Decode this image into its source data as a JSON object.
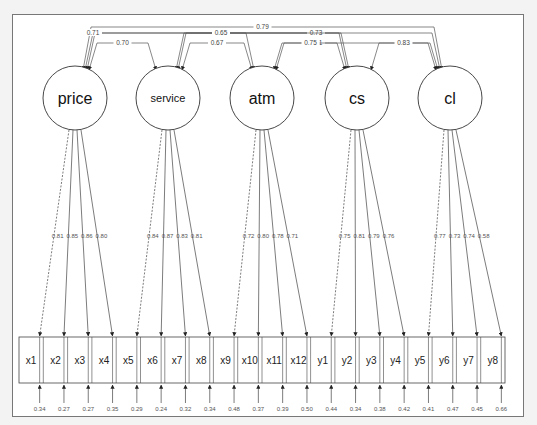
{
  "diagram": {
    "type": "CFA path diagram",
    "latents": [
      {
        "id": "price",
        "label": "price",
        "cx": 75,
        "font": 16
      },
      {
        "id": "service",
        "label": "service",
        "cx": 168,
        "font": 11
      },
      {
        "id": "atm",
        "label": "atm",
        "cx": 262,
        "font": 16
      },
      {
        "id": "cs",
        "label": "cs",
        "cx": 357,
        "font": 16
      },
      {
        "id": "cl",
        "label": "cl",
        "cx": 450,
        "font": 16
      }
    ],
    "indicators": [
      {
        "label": "x1",
        "factor": "price",
        "loading": "0.81",
        "error": "0.34",
        "fixed": true
      },
      {
        "label": "x2",
        "factor": "price",
        "loading": "0.85",
        "error": "0.27",
        "fixed": false
      },
      {
        "label": "x3",
        "factor": "price",
        "loading": "0.86",
        "error": "0.27",
        "fixed": false
      },
      {
        "label": "x4",
        "factor": "price",
        "loading": "0.80",
        "error": "0.35",
        "fixed": false
      },
      {
        "label": "x5",
        "factor": "service",
        "loading": "0.84",
        "error": "0.29",
        "fixed": true
      },
      {
        "label": "x6",
        "factor": "service",
        "loading": "0.87",
        "error": "0.24",
        "fixed": false
      },
      {
        "label": "x7",
        "factor": "service",
        "loading": "0.83",
        "error": "0.32",
        "fixed": false
      },
      {
        "label": "x8",
        "factor": "service",
        "loading": "0.81",
        "error": "0.34",
        "fixed": false
      },
      {
        "label": "x9",
        "factor": "atm",
        "loading": "0.72",
        "error": "0.48",
        "fixed": true
      },
      {
        "label": "x10",
        "factor": "atm",
        "loading": "0.80",
        "error": "0.37",
        "fixed": false
      },
      {
        "label": "x11",
        "factor": "atm",
        "loading": "0.78",
        "error": "0.39",
        "fixed": false
      },
      {
        "label": "x12",
        "factor": "atm",
        "loading": "0.71",
        "error": "0.50",
        "fixed": false
      },
      {
        "label": "y1",
        "factor": "cs",
        "loading": "0.75",
        "error": "0.44",
        "fixed": true
      },
      {
        "label": "y2",
        "factor": "cs",
        "loading": "0.81",
        "error": "0.34",
        "fixed": false
      },
      {
        "label": "y3",
        "factor": "cs",
        "loading": "0.79",
        "error": "0.38",
        "fixed": false
      },
      {
        "label": "y4",
        "factor": "cs",
        "loading": "0.76",
        "error": "0.42",
        "fixed": false
      },
      {
        "label": "y5",
        "factor": "cl",
        "loading": "0.77",
        "error": "0.41",
        "fixed": true
      },
      {
        "label": "y6",
        "factor": "cl",
        "loading": "0.73",
        "error": "0.47",
        "fixed": false
      },
      {
        "label": "y7",
        "factor": "cl",
        "loading": "0.74",
        "error": "0.45",
        "fixed": false
      },
      {
        "label": "y8",
        "factor": "cl",
        "loading": "0.58",
        "error": "0.66",
        "fixed": false
      }
    ],
    "correlations": [
      {
        "from": "price",
        "to": "cl",
        "value": "0.79",
        "level": 0
      },
      {
        "from": "price",
        "to": "cs",
        "value": "0.53",
        "level": 1
      },
      {
        "from": "service",
        "to": "cl",
        "value": "0.73",
        "level": 1
      },
      {
        "from": "price",
        "to": "atm",
        "value": "0.71",
        "level": 2
      },
      {
        "from": "service",
        "to": "cs",
        "value": "0.65",
        "level": 2
      },
      {
        "from": "price",
        "to": "service",
        "value": "0.70",
        "level": 3
      },
      {
        "from": "service",
        "to": "atm",
        "value": "0.67",
        "level": 3
      },
      {
        "from": "atm",
        "to": "cl",
        "value": "0.61",
        "level": 3
      },
      {
        "from": "atm",
        "to": "cs",
        "value": "0.75",
        "level": 3
      },
      {
        "from": "cs",
        "to": "cl",
        "value": "0.83",
        "level": 3
      }
    ]
  }
}
